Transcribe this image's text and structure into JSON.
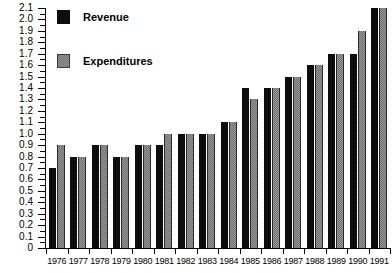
{
  "chart_data": {
    "type": "bar",
    "title": "",
    "xlabel": "",
    "ylabel": "",
    "ylim": [
      0,
      2.1
    ],
    "ytick_step": 0.1,
    "minor_ticks": true,
    "grid": false,
    "legend_position": "top-left",
    "categories": [
      "1976",
      "1977",
      "1978",
      "1979",
      "1980",
      "1981",
      "1982",
      "1983",
      "1984",
      "1985",
      "1986",
      "1987",
      "1988",
      "1989",
      "1990",
      "1991"
    ],
    "ytick_labels": [
      "2.1",
      "2.0",
      "1.9",
      "1.8",
      "1.7",
      "1.6",
      "1.5",
      "1.4",
      "1.3",
      "1.2",
      "1.1",
      "1.0",
      "0.9",
      "0.8",
      "0.7",
      "0.6",
      "0.5",
      "0.4",
      "0.3",
      "0.2",
      "0.1",
      "0"
    ],
    "series": [
      {
        "name": "Revenue",
        "color": "#0d0d0d",
        "values": [
          0.7,
          0.8,
          0.9,
          0.8,
          0.9,
          0.9,
          1.0,
          1.0,
          1.1,
          1.4,
          1.4,
          1.5,
          1.6,
          1.7,
          1.7,
          2.1
        ]
      },
      {
        "name": "Expenditures",
        "color": "#6e6e6e",
        "values": [
          0.9,
          0.8,
          0.9,
          0.8,
          0.9,
          1.0,
          1.0,
          1.0,
          1.1,
          1.3,
          1.4,
          1.5,
          1.6,
          1.7,
          1.9,
          2.1
        ]
      }
    ]
  },
  "legend": {
    "items": [
      {
        "label": "Revenue"
      },
      {
        "label": "Expenditures"
      }
    ]
  },
  "title_strip": {
    "text": ""
  }
}
